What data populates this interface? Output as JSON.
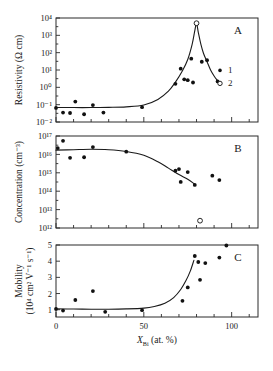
{
  "figure": {
    "xaxis": {
      "label_main": "X",
      "label_sub": "Bi",
      "label_tail": " (at. %)",
      "ticks": [
        0,
        50,
        100
      ],
      "tick_labels": [
        "0",
        "50",
        "100"
      ],
      "minor_step": 10,
      "min": 0,
      "max": 115
    },
    "panels": [
      {
        "letter": "A",
        "ylabel_line1": "Resistivity (Ω cm)",
        "yscale": "log",
        "ymin_exp": -2,
        "ymax_exp": 4,
        "ytick_exps": [
          -2,
          -1,
          0,
          1,
          2,
          3,
          4
        ],
        "ytick_labels": [
          "10⁻²",
          "10⁻¹",
          "10⁰",
          "10¹",
          "10²",
          "10³",
          "10⁴"
        ],
        "series": [
          {
            "name": "1",
            "marker": "filled",
            "points": [
              [
                0,
                0.065
              ],
              [
                4,
                0.035
              ],
              [
                8,
                0.033
              ],
              [
                11,
                0.15
              ],
              [
                16,
                0.028
              ],
              [
                21,
                0.095
              ],
              [
                27,
                0.035
              ],
              [
                49,
                0.072
              ],
              [
                68,
                1.6
              ],
              [
                71,
                12
              ],
              [
                73,
                2.9
              ],
              [
                75,
                2.6
              ],
              [
                77,
                45
              ],
              [
                78,
                1.9
              ],
              [
                83,
                30
              ],
              [
                86,
                37
              ],
              [
                92,
                2.2
              ]
            ]
          },
          {
            "name": "2",
            "marker": "open",
            "points": [
              [
                80,
                5000
              ]
            ]
          }
        ],
        "fit_curve": [
          [
            0,
            0.068
          ],
          [
            10,
            0.068
          ],
          [
            20,
            0.068
          ],
          [
            30,
            0.07
          ],
          [
            40,
            0.075
          ],
          [
            50,
            0.095
          ],
          [
            58,
            0.2
          ],
          [
            64,
            0.6
          ],
          [
            68,
            2.0
          ],
          [
            72,
            9
          ],
          [
            75,
            40
          ],
          [
            77.5,
            300
          ],
          [
            79,
            1800
          ],
          [
            80,
            5000
          ],
          [
            81,
            1500
          ],
          [
            82.5,
            300
          ],
          [
            84,
            90
          ],
          [
            86,
            30
          ],
          [
            88,
            10
          ],
          [
            90,
            4.5
          ],
          [
            92,
            2.4
          ]
        ],
        "legend": [
          {
            "marker": "filled",
            "label": "1"
          },
          {
            "marker": "open",
            "label": "2"
          }
        ]
      },
      {
        "letter": "B",
        "ylabel_line1": "Concentration (cm⁻³)",
        "yscale": "log",
        "ymin_exp": 12,
        "ymax_exp": 17,
        "ytick_exps": [
          12,
          13,
          14,
          15,
          16,
          17
        ],
        "ytick_labels": [
          "10¹²",
          "10¹³",
          "10¹⁴",
          "10¹⁵",
          "10¹⁶",
          "10¹⁷"
        ],
        "series": [
          {
            "name": "1",
            "marker": "filled",
            "points": [
              [
                1,
                2.2e+16
              ],
              [
                4,
                5.5e+16
              ],
              [
                8,
                6500000000000000.0
              ],
              [
                16,
                7000000000000000.0
              ],
              [
                21,
                2.5e+16
              ],
              [
                40,
                1.4e+16
              ],
              [
                68,
                1300000000000000.0
              ],
              [
                70,
                1600000000000000.0
              ],
              [
                71,
                320000000000000.0
              ],
              [
                75,
                1100000000000000.0
              ],
              [
                79,
                220000000000000.0
              ],
              [
                89,
                700000000000000.0
              ],
              [
                93,
                400000000000000.0
              ]
            ]
          },
          {
            "name": "2",
            "marker": "open",
            "points": [
              [
                82,
                2500000000000.0
              ]
            ]
          }
        ],
        "fit_curve": [
          [
            0,
            1.7e+16
          ],
          [
            10,
            1.8e+16
          ],
          [
            20,
            1.9e+16
          ],
          [
            30,
            1.8e+16
          ],
          [
            40,
            1.45e+16
          ],
          [
            50,
            9000000000000000.0
          ],
          [
            58,
            4000000000000000.0
          ],
          [
            64,
            1800000000000000.0
          ],
          [
            70,
            800000000000000.0
          ],
          [
            75,
            450000000000000.0
          ],
          [
            79,
            240000000000000.0
          ]
        ]
      },
      {
        "letter": "C",
        "ylabel_line1": "Mobility",
        "ylabel_line2": "(10⁴ cm² V⁻¹ s⁻¹)",
        "yscale": "linear",
        "ymin": 0.55,
        "ymax": 5.0,
        "yticks": [
          1,
          2,
          3,
          4,
          5
        ],
        "ytick_labels": [
          "1",
          "2",
          "3",
          "4",
          "5"
        ],
        "series": [
          {
            "name": "1",
            "marker": "filled",
            "points": [
              [
                0,
                1.05
              ],
              [
                4,
                0.95
              ],
              [
                11,
                1.6
              ],
              [
                21,
                2.15
              ],
              [
                28,
                0.87
              ],
              [
                49,
                0.97
              ],
              [
                72,
                1.55
              ],
              [
                75,
                2.38
              ],
              [
                79,
                4.32
              ],
              [
                81,
                3.95
              ],
              [
                82,
                2.85
              ],
              [
                85,
                3.88
              ],
              [
                93,
                4.22
              ],
              [
                97,
                4.97
              ]
            ]
          }
        ],
        "fit_curve": [
          [
            0,
            1.05
          ],
          [
            10,
            1.04
          ],
          [
            20,
            1.03
          ],
          [
            30,
            1.03
          ],
          [
            40,
            1.05
          ],
          [
            50,
            1.1
          ],
          [
            56,
            1.2
          ],
          [
            62,
            1.4
          ],
          [
            67,
            1.75
          ],
          [
            71,
            2.25
          ],
          [
            74,
            2.8
          ],
          [
            76.5,
            3.4
          ],
          [
            78.5,
            4.05
          ]
        ]
      }
    ]
  }
}
